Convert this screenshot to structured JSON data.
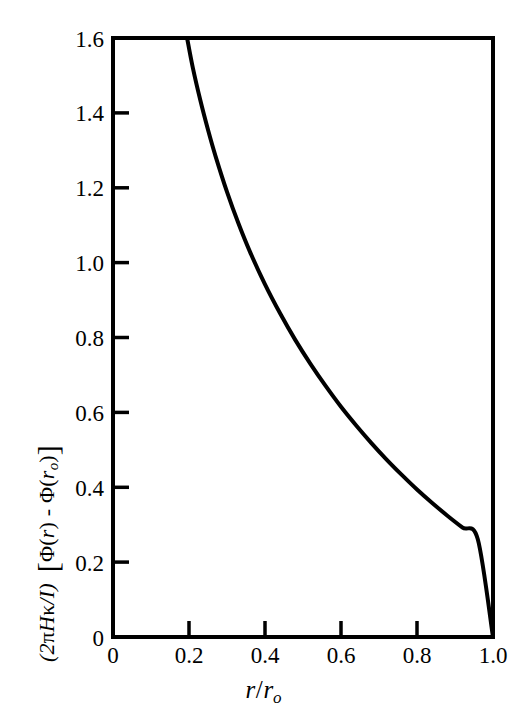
{
  "figure": {
    "background_color": "#ffffff",
    "ink_color": "#000000"
  },
  "chart_data": {
    "type": "line",
    "title": "",
    "subtitle": "",
    "xlabel": "r/r₀",
    "ylabel": "(2πHκ/I) [Φ(r) - Φ(r₀)]",
    "xlim": [
      0,
      1.0
    ],
    "ylim": [
      0,
      1.6
    ],
    "xticks": [
      0,
      0.2,
      0.4,
      0.6,
      0.8,
      1.0
    ],
    "xtick_labels": [
      "0",
      "0.2",
      "0.4",
      "0.6",
      "0.8",
      "1.0"
    ],
    "yticks": [
      0,
      0.2,
      0.4,
      0.6,
      0.8,
      1.0,
      1.2,
      1.4,
      1.6
    ],
    "ytick_labels": [
      "0",
      "0.2",
      "0.4",
      "0.6",
      "0.8",
      "1.0",
      "1.2",
      "1.4",
      "1.6"
    ],
    "grid": false,
    "legend": false,
    "legend_position": "none",
    "tick_direction": "in",
    "frame": "full-box",
    "series": [
      {
        "name": "(2πHκ/I) [Φ(r) - Φ(r₀)]",
        "line_color": "#000000",
        "line_width": 4,
        "x": [
          0.195,
          0.21,
          0.23,
          0.25,
          0.27,
          0.3,
          0.33,
          0.36,
          0.4,
          0.44,
          0.48,
          0.52,
          0.56,
          0.6,
          0.64,
          0.68,
          0.72,
          0.76,
          0.8,
          0.84,
          0.88,
          0.92,
          0.96,
          1.0
        ],
        "y": [
          1.6,
          1.521,
          1.433,
          1.355,
          1.284,
          1.189,
          1.105,
          1.03,
          0.942,
          0.864,
          0.793,
          0.729,
          0.67,
          0.615,
          0.565,
          0.518,
          0.474,
          0.433,
          0.394,
          0.358,
          0.324,
          0.292,
          0.261,
          0.0
        ],
        "endpoints": [
          {
            "x": 0.195,
            "y": 1.6,
            "note": "curve meets top frame"
          },
          {
            "x": 1.0,
            "y": 0.0,
            "note": "curve meets bottom-right corner"
          }
        ]
      }
    ]
  },
  "y_axis_title_parts": {
    "prefix_open": "(2",
    "pi": "π",
    "H": "H",
    "kappa": "κ",
    "slash": "/",
    "I": "I",
    "prefix_close": ")",
    "bracket_open": "[",
    "phi1": "Φ",
    "arg1_open": "(",
    "r1": "r",
    "arg1_close": ")",
    "minus": "-",
    "phi2": "Φ",
    "arg2_open": "(",
    "r2": "r",
    "r2_sub": "o",
    "arg2_close": ")",
    "bracket_close": "]"
  },
  "x_axis_title_parts": {
    "numerator": "r",
    "slash": "/",
    "denominator": "r",
    "denominator_sub": "o"
  }
}
